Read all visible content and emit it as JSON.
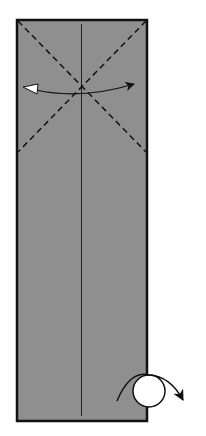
{
  "diagram": {
    "paper_color": "#8f8f8f",
    "line_color": "#111111",
    "elements": [
      {
        "type": "paper-rectangle",
        "description": "tall rectangle of paper, grey side up"
      },
      {
        "type": "center-crease",
        "description": "vertical center crease line"
      },
      {
        "type": "valley-fold-diagonal",
        "description": "dashed diagonal from top-left corner"
      },
      {
        "type": "valley-fold-diagonal",
        "description": "dashed diagonal from top-right corner"
      },
      {
        "type": "fold-and-unfold-arrow",
        "description": "curved arrow with black head right and white head left"
      },
      {
        "type": "turn-over-symbol",
        "description": "circle with curved arrow at bottom-right"
      }
    ]
  }
}
